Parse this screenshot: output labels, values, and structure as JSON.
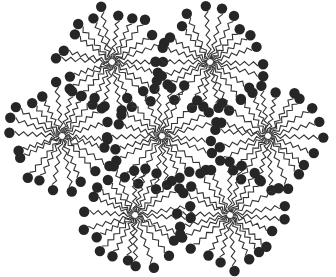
{
  "diagram": {
    "type": "micelle-packing",
    "width": 336,
    "height": 277,
    "colors": {
      "background": "#ffffff",
      "head": "#262626",
      "tail": "#333333",
      "core": "#888888"
    },
    "head_radius": 5.2,
    "tail_length": 42,
    "micelles": [
      {
        "id": "micelle-top-left",
        "cx": 112,
        "cy": 62,
        "arms": 22
      },
      {
        "id": "micelle-top-right",
        "cx": 210,
        "cy": 62,
        "arms": 22
      },
      {
        "id": "micelle-middle-left",
        "cx": 62,
        "cy": 136,
        "arms": 22
      },
      {
        "id": "micelle-center",
        "cx": 162,
        "cy": 136,
        "arms": 22
      },
      {
        "id": "micelle-middle-right",
        "cx": 268,
        "cy": 136,
        "arms": 22
      },
      {
        "id": "micelle-bottom-left",
        "cx": 135,
        "cy": 215,
        "arms": 22
      },
      {
        "id": "micelle-bottom-right",
        "cx": 230,
        "cy": 215,
        "arms": 22
      }
    ]
  }
}
